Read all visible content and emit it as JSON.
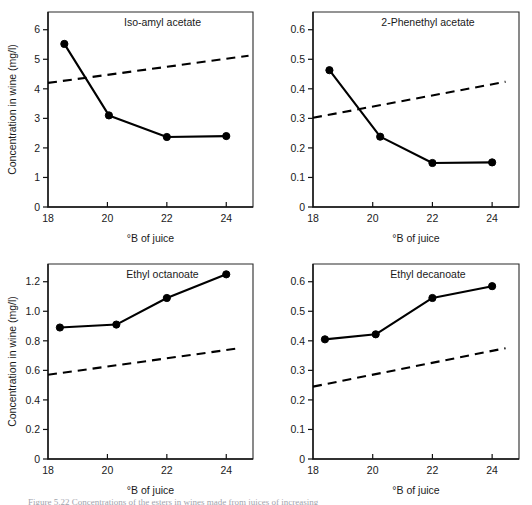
{
  "figure": {
    "caption": "Figure 5.22  Concentrations of the esters in wines made from juices of increasing",
    "xlabel": "°B of juice",
    "ylabel": "Concentration in wine (mg/l)"
  },
  "chart_data": [
    {
      "type": "line",
      "title": "Iso-amyl acetate",
      "xlabel": "°B of juice",
      "ylabel": "Concentration in wine (mg/l)",
      "xlim": [
        18,
        24.9
      ],
      "ylim": [
        0,
        6.6
      ],
      "xticks": [
        18,
        20,
        22,
        24
      ],
      "xticklabels": [
        "18",
        "20",
        "22",
        "24"
      ],
      "yticks": [
        0,
        1,
        2,
        3,
        4,
        5,
        6
      ],
      "yticklabels": [
        "0",
        "1",
        "2",
        "3",
        "4",
        "5",
        "6"
      ],
      "grid": false,
      "legend": "none",
      "series": [
        {
          "name": "measured",
          "style": "solid",
          "markers": true,
          "x": [
            18.55,
            20.05,
            22.0,
            24.0
          ],
          "values": [
            5.52,
            3.1,
            2.37,
            2.4
          ]
        },
        {
          "name": "expected",
          "style": "dashed",
          "markers": false,
          "x": [
            18.0,
            24.75
          ],
          "values": [
            4.2,
            5.12
          ]
        }
      ]
    },
    {
      "type": "line",
      "title": "2-Phenethyl acetate",
      "xlabel": "°B of juice",
      "ylabel": "",
      "xlim": [
        18,
        24.9
      ],
      "ylim": [
        0,
        0.66
      ],
      "xticks": [
        18,
        20,
        22,
        24
      ],
      "xticklabels": [
        "18",
        "20",
        "22",
        "24"
      ],
      "yticks": [
        0,
        0.1,
        0.2,
        0.3,
        0.4,
        0.5,
        0.6
      ],
      "yticklabels": [
        "0",
        "0.1",
        "0.2",
        "0.3",
        "0.4",
        "0.5",
        "0.6"
      ],
      "grid": false,
      "legend": "none",
      "series": [
        {
          "name": "measured",
          "style": "solid",
          "markers": true,
          "x": [
            18.55,
            20.25,
            22.0,
            24.0
          ],
          "values": [
            0.463,
            0.238,
            0.149,
            0.151
          ]
        },
        {
          "name": "expected",
          "style": "dashed",
          "markers": false,
          "x": [
            18.0,
            24.45
          ],
          "values": [
            0.302,
            0.424
          ]
        }
      ]
    },
    {
      "type": "line",
      "title": "Ethyl octanoate",
      "xlabel": "°B of juice",
      "ylabel": "Concentration in wine (mg/l)",
      "xlim": [
        18,
        24.9
      ],
      "ylim": [
        0,
        1.32
      ],
      "xticks": [
        18,
        20,
        22,
        24
      ],
      "xticklabels": [
        "18",
        "20",
        "22",
        "24"
      ],
      "yticks": [
        0,
        0.2,
        0.4,
        0.6,
        0.8,
        1.0,
        1.2
      ],
      "yticklabels": [
        "0",
        "0.2",
        "0.4",
        "0.6",
        "0.8",
        "1.0",
        "1.2"
      ],
      "grid": false,
      "legend": "none",
      "series": [
        {
          "name": "measured",
          "style": "solid",
          "markers": true,
          "x": [
            18.4,
            20.3,
            22.0,
            24.0
          ],
          "values": [
            0.89,
            0.91,
            1.09,
            1.25
          ]
        },
        {
          "name": "expected",
          "style": "dashed",
          "markers": false,
          "x": [
            18.0,
            24.45
          ],
          "values": [
            0.57,
            0.75
          ]
        }
      ]
    },
    {
      "type": "line",
      "title": "Ethyl decanoate",
      "xlabel": "°B of juice",
      "ylabel": "",
      "xlim": [
        18,
        24.9
      ],
      "ylim": [
        0,
        0.66
      ],
      "xticks": [
        18,
        20,
        22,
        24
      ],
      "xticklabels": [
        "18",
        "20",
        "22",
        "24"
      ],
      "yticks": [
        0,
        0.1,
        0.2,
        0.3,
        0.4,
        0.5,
        0.6
      ],
      "yticklabels": [
        "0",
        "0.1",
        "0.2",
        "0.3",
        "0.4",
        "0.5",
        "0.6"
      ],
      "grid": false,
      "legend": "none",
      "series": [
        {
          "name": "measured",
          "style": "solid",
          "markers": true,
          "x": [
            18.4,
            20.1,
            22.0,
            24.0
          ],
          "values": [
            0.405,
            0.422,
            0.545,
            0.585
          ]
        },
        {
          "name": "expected",
          "style": "dashed",
          "markers": false,
          "x": [
            18.0,
            24.45
          ],
          "values": [
            0.245,
            0.375
          ]
        }
      ]
    }
  ]
}
